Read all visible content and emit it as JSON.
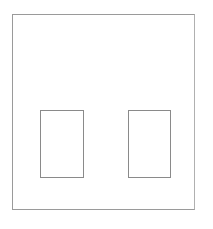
{
  "diagram": {
    "title": "",
    "elements": [
      {
        "id": "outer-frame",
        "shape": "rectangle",
        "label": ""
      },
      {
        "id": "left-pane",
        "shape": "rectangle",
        "label": ""
      },
      {
        "id": "right-pane",
        "shape": "rectangle",
        "label": ""
      }
    ],
    "colors": {
      "background": "#ffffff",
      "stroke": "#8a8a8a"
    }
  }
}
